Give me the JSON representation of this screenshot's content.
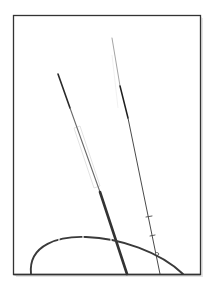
{
  "figure": {
    "width": 217,
    "height": 291,
    "background": "#ffffff",
    "frame": {
      "x": 13,
      "y": 15,
      "width": 187,
      "height": 259,
      "stroke": "#333333",
      "shadow": "#bdbdbd"
    },
    "colors": {
      "ink_dark": "#2a2a2a",
      "ink_mid": "#5a5a5a",
      "ink_light": "#9a9a9a",
      "ghost": "#dcdcdc",
      "arc": "#3a3a3a"
    },
    "elements": [
      {
        "id": "left-line",
        "type": "line",
        "from": [
          58,
          74
        ],
        "to": [
          127,
          274
        ]
      },
      {
        "id": "right-line",
        "type": "line",
        "from": [
          112,
          38
        ],
        "to": [
          160,
          274
        ]
      },
      {
        "id": "arc",
        "type": "arc",
        "start": [
          30,
          274
        ],
        "peak": [
          80,
          237
        ],
        "end": [
          183,
          274
        ]
      }
    ]
  }
}
